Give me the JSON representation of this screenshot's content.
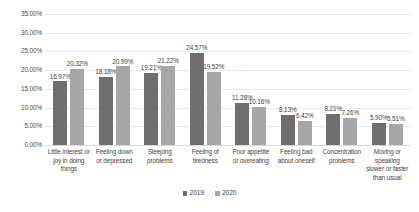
{
  "chart_data": {
    "type": "bar",
    "title": "",
    "xlabel": "",
    "ylabel": "",
    "ylim": [
      0,
      35
    ],
    "ytick_labels": [
      "35.00%",
      "30.00%",
      "25.00%",
      "20.00%",
      "15.00%",
      "10.00%",
      "5.00%",
      "0.00%"
    ],
    "ytick_values": [
      35,
      30,
      25,
      20,
      15,
      10,
      5,
      0
    ],
    "grid": true,
    "legend_position": "bottom",
    "categories": [
      "Little interest or joy in doing things",
      "Feeling down or depressed",
      "Sleeping problems",
      "Feeling of tiredness",
      "Poor appetite or overeating",
      "Feeling bad about oneself",
      "Concentration problems",
      "Moving or speaking slower or faster than usual"
    ],
    "series": [
      {
        "name": "2019",
        "color": "#6e6e6e",
        "values": [
          16.97,
          18.18,
          19.21,
          24.57,
          11.28,
          8.13,
          8.21,
          5.9
        ],
        "labels": [
          "16.97%",
          "18.18%",
          "19.21%",
          "24.57%",
          "11.28%",
          "8.13%",
          "8.21%",
          "5.90%"
        ]
      },
      {
        "name": "2020",
        "color": "#a6a6a6",
        "values": [
          20.32,
          20.99,
          21.22,
          19.52,
          10.16,
          6.42,
          7.26,
          5.51
        ],
        "labels": [
          "20.32%",
          "20.99%",
          "21.22%",
          "19.52%",
          "10.16%",
          "6.42%",
          "7.26%",
          "5.51%"
        ]
      }
    ]
  }
}
